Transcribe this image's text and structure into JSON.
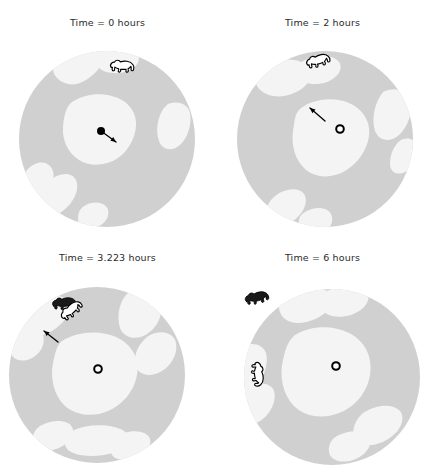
{
  "figure": {
    "type": "multi-panel-map",
    "rows": 2,
    "columns": 2,
    "background_color": "#ffffff",
    "sea_color": "#d0d0d0",
    "ice_color": "#f4f4f4",
    "marker_color": "#000000",
    "bear_outline_color": "#000000",
    "bear_fill_white": "#ffffff",
    "bear_fill_black": "#1a1a1a",
    "units": "hours"
  },
  "panels": [
    {
      "id": "panel-0h",
      "title": "Time = 0 hours",
      "time_value": 0,
      "center_marker": {
        "style": "filled-dot",
        "cx": 101,
        "cy": 131,
        "r": 4.0
      },
      "arrow": {
        "from_x": 101,
        "from_y": 131,
        "to_x": 116,
        "to_y": 142
      },
      "bears": [
        {
          "name": "bear-white-0h",
          "kind": "white",
          "x": 109,
          "y": 58,
          "rotation": 0,
          "scale": 1.0
        }
      ],
      "disc": {
        "cx": 107,
        "cy": 139,
        "r": 88
      },
      "ice_floes": [
        "M 60 55 C 70 48 86 46 96 52 C 104 57 102 66 96 72 C 88 80 78 86 68 84 C 58 82 52 74 53 66 C 54 60 56 58 60 55 Z",
        "M 96 52 C 110 44 128 44 136 52 C 142 58 138 66 130 70 C 120 75 106 74 99 68 C 94 63 92 56 96 52 Z",
        "M 72 102 C 86 93 104 92 118 98 C 130 103 137 114 136 126 C 135 139 128 151 118 158 C 106 166 90 167 79 160 C 68 153 62 140 63 127 C 64 115 66 107 72 102 Z",
        "M 168 104 C 178 100 188 104 190 113 C 192 124 188 138 180 145 C 172 152 162 150 159 141 C 155 130 158 116 164 108 Z",
        "M 27 170 C 34 162 44 160 50 166 C 56 172 54 182 47 190 C 40 198 30 200 25 194 C 20 188 21 178 27 170 Z",
        "M 50 180 C 60 172 72 172 76 180 C 80 189 74 202 64 210 C 54 218 43 218 39 210 C 35 201 41 188 50 180 Z",
        "M 86 205 C 96 200 106 203 108 210 C 110 218 103 226 94 228 C 85 230 78 226 78 219 C 78 212 80 208 86 205 Z"
      ]
    },
    {
      "id": "panel-2h",
      "title": "Time = 2 hours",
      "time_value": 2,
      "center_marker": {
        "style": "ring-dot",
        "cx": 125,
        "cy": 129,
        "r": 3.8
      },
      "arrow": {
        "from_x": 110,
        "from_y": 121,
        "to_x": 95,
        "to_y": 108
      },
      "bears": [
        {
          "name": "bear-white-2h",
          "kind": "white",
          "x": 88,
          "y": 57,
          "rotation": -18,
          "scale": 1.0
        }
      ],
      "disc": {
        "cx": 110,
        "cy": 139,
        "r": 88
      },
      "ice_floes": [
        "M 44 70 C 56 60 74 57 86 62 C 96 66 98 76 92 84 C 84 93 70 98 58 96 C 46 94 39 85 40 77 C 41 73 42 72 44 70 Z",
        "M 86 62 C 100 54 118 54 124 62 C 129 69 122 78 112 82 C 100 86 88 84 83 77 C 79 71 81 65 86 62 Z",
        "M 86 108 C 100 98 120 97 134 103 C 148 109 156 122 154 136 C 152 151 142 164 130 171 C 116 179 100 178 90 169 C 80 160 76 145 78 131 C 80 118 80 113 86 108 Z",
        "M 168 92 C 180 86 192 90 195 100 C 198 112 193 127 184 135 C 175 143 164 141 160 131 C 156 118 160 102 168 92 Z",
        "M 186 140 C 194 136 202 140 203 148 C 204 158 198 168 190 172 C 182 176 175 172 175 164 C 175 154 179 145 186 140 Z",
        "M 60 196 C 70 188 84 187 89 194 C 94 202 88 214 78 221 C 68 228 56 228 52 221 C 48 213 52 203 60 196 Z",
        "M 90 212 C 100 206 112 207 116 214 C 120 222 114 231 104 234 C 94 237 85 234 84 226 C 83 219 85 215 90 212 Z"
      ]
    },
    {
      "id": "panel-3223h",
      "title": "Time = 3.223 hours",
      "time_value": 3.223,
      "center_marker": {
        "style": "ring-dot",
        "cx": 98,
        "cy": 134,
        "r": 3.8
      },
      "arrow": {
        "from_x": 58,
        "from_y": 107,
        "to_x": 44,
        "to_y": 96
      },
      "bears": [
        {
          "name": "bear-black-3223h",
          "kind": "black",
          "x": 50,
          "y": 62,
          "rotation": -8,
          "scale": 1.0
        },
        {
          "name": "bear-white-3223h",
          "kind": "white",
          "x": 56,
          "y": 78,
          "rotation": -42,
          "scale": 1.0
        }
      ],
      "disc": {
        "cx": 97,
        "cy": 140,
        "r": 88
      },
      "ice_floes": [
        "M 22 68 C 34 58 52 56 62 62 C 72 68 70 80 62 88 C 52 98 38 104 28 100 C 18 96 13 86 15 77 C 17 72 18 71 22 68 Z",
        "M 18 96 C 28 90 40 92 43 100 C 46 109 40 120 30 124 C 20 128 11 124 10 115 C 9 106 11 101 18 96 Z",
        "M 128 58 C 142 52 156 56 160 66 C 164 78 158 92 147 99 C 136 106 124 103 120 93 C 116 80 120 65 128 58 Z",
        "M 150 100 C 162 94 174 98 176 108 C 178 120 170 133 158 138 C 146 143 136 138 135 128 C 134 115 142 105 150 100 Z",
        "M 62 106 C 78 96 100 95 116 102 C 132 109 140 124 137 140 C 134 157 122 170 108 176 C 92 183 74 180 64 170 C 54 160 50 143 53 128 C 56 114 57 111 62 106 Z",
        "M 42 190 C 54 184 68 185 72 192 C 76 200 68 210 56 214 C 44 218 34 214 33 206 C 32 198 36 193 42 190 Z",
        "M 72 196 C 90 188 112 189 124 196 C 134 202 130 212 116 217 C 98 223 76 222 68 215 C 62 209 65 199 72 196 Z",
        "M 124 198 C 136 194 148 197 150 204 C 152 212 144 221 132 224 C 120 227 111 223 111 216 C 111 208 117 201 124 198 Z"
      ]
    },
    {
      "id": "panel-6h",
      "title": "Time = 6 hours",
      "time_value": 6,
      "center_marker": {
        "style": "ring-dot",
        "cx": 121,
        "cy": 131,
        "r": 3.8
      },
      "arrow": null,
      "bears": [
        {
          "name": "bear-black-6h",
          "kind": "black",
          "x": 27,
          "y": 58,
          "rotation": -14,
          "scale": 1.0
        },
        {
          "name": "bear-white-6h",
          "kind": "white",
          "x": 49,
          "y": 125,
          "rotation": 82,
          "scale": 1.0
        }
      ],
      "disc": {
        "cx": 117,
        "cy": 142,
        "r": 88
      },
      "ice_floes": [
        "M 74 60 C 86 52 102 50 112 56 C 120 61 118 71 110 78 C 100 86 86 90 76 87 C 66 84 62 74 65 67 C 67 63 70 62 74 60 Z",
        "M 112 56 C 128 48 146 48 152 58 C 157 66 148 76 136 80 C 122 84 110 81 106 73 C 103 66 107 59 112 56 Z",
        "M 80 100 C 96 90 118 90 134 98 C 150 106 158 122 155 140 C 152 158 140 172 124 178 C 106 185 88 181 78 170 C 68 159 64 141 68 125 C 71 111 74 105 80 100 Z",
        "M 26 112 C 36 106 48 109 51 118 C 54 130 48 146 38 154 C 28 162 17 158 15 148 C 13 134 18 119 26 112 Z",
        "M 34 152 C 44 146 56 148 59 156 C 62 166 55 180 45 186 C 35 192 25 188 24 178 C 23 167 27 157 34 152 Z",
        "M 148 178 C 160 170 176 168 184 175 C 191 182 187 194 176 202 C 164 211 149 213 142 206 C 135 198 139 186 148 178 Z",
        "M 124 200 C 136 194 150 195 154 203 C 158 211 150 221 138 225 C 126 229 115 225 114 217 C 113 209 117 203 124 200 Z"
      ]
    }
  ]
}
